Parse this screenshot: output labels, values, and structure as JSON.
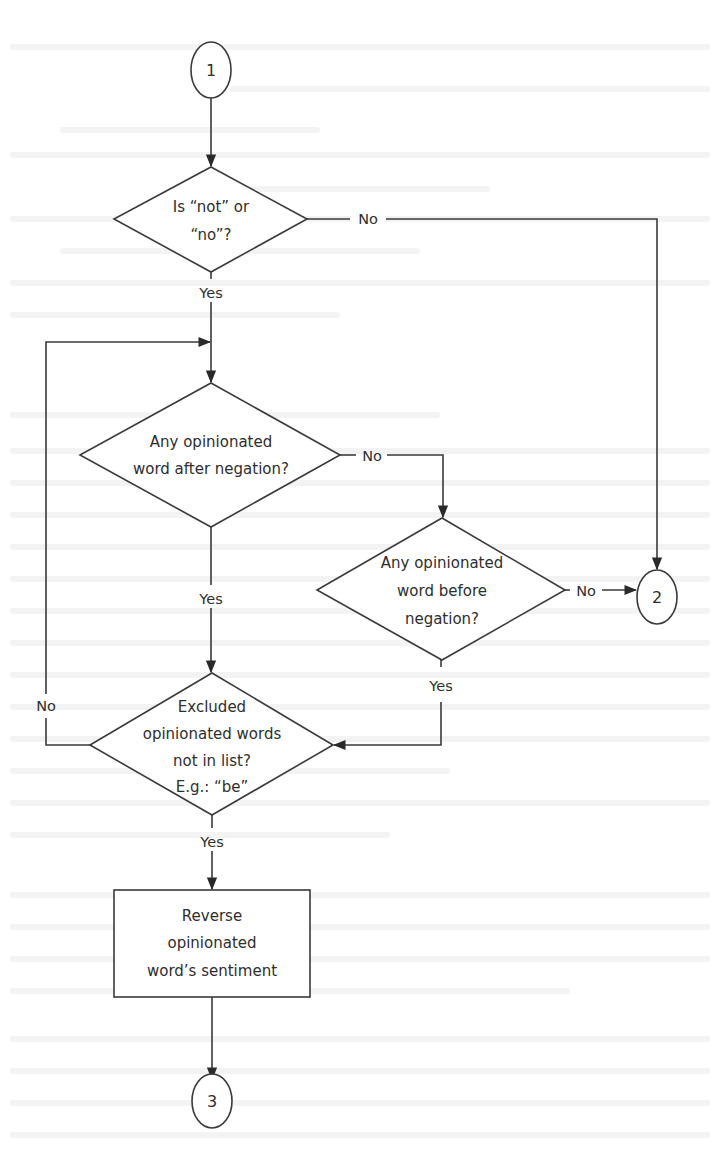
{
  "diagram": {
    "type": "flowchart",
    "connectors": {
      "start": {
        "label": "1"
      },
      "exit_no_negation": {
        "label": "2"
      },
      "end": {
        "label": "3"
      }
    },
    "decisions": [
      {
        "id": "is_negation",
        "lines": [
          "Is “not” or",
          "“no”?"
        ]
      },
      {
        "id": "opinion_after",
        "lines": [
          "Any opinionated",
          "word after negation?"
        ]
      },
      {
        "id": "opinion_before",
        "lines": [
          "Any opinionated",
          "word before",
          "negation?"
        ]
      },
      {
        "id": "excluded_check",
        "lines": [
          "Excluded",
          "opinionated words",
          "not in list?",
          "E.g.: “be”"
        ]
      }
    ],
    "process": {
      "id": "reverse",
      "lines": [
        "Reverse",
        "opinionated",
        "word’s sentiment"
      ]
    },
    "edges": [
      {
        "from": "1",
        "to": "is_negation",
        "label": ""
      },
      {
        "from": "is_negation",
        "to": "2",
        "label": "No"
      },
      {
        "from": "is_negation",
        "to": "opinion_after",
        "label": "Yes"
      },
      {
        "from": "opinion_after",
        "to": "opinion_before",
        "label": "No"
      },
      {
        "from": "opinion_after",
        "to": "excluded_check",
        "label": "Yes"
      },
      {
        "from": "opinion_before",
        "to": "2",
        "label": "No"
      },
      {
        "from": "opinion_before",
        "to": "excluded_check",
        "label": "Yes"
      },
      {
        "from": "excluded_check",
        "to": "opinion_after",
        "label": "No"
      },
      {
        "from": "excluded_check",
        "to": "reverse",
        "label": "Yes"
      },
      {
        "from": "reverse",
        "to": "3",
        "label": ""
      }
    ],
    "labels": {
      "yes": "Yes",
      "no": "No"
    }
  }
}
